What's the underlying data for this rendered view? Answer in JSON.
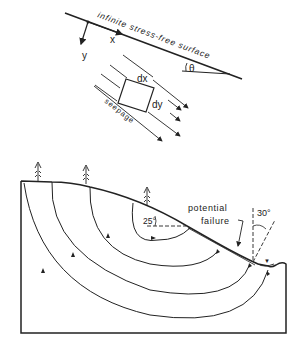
{
  "top_figure": {
    "surface_label": "infinite stress-free surface",
    "x_axis_label": "x",
    "y_axis_label": "y",
    "angle_label": "θ",
    "element_dx_label": "dx",
    "element_dy_label": "dy",
    "flow_label": "seepage"
  },
  "bottom_figure": {
    "angle_slope_label": "25°",
    "failure_label_line1": "potential",
    "failure_label_line2": "failure",
    "angle_seep_label": "30°",
    "trees": [
      "tree-1",
      "tree-2",
      "tree-3"
    ],
    "water_table_symbol": "▼"
  },
  "colors": {
    "ink": "#222222",
    "background": "#ffffff"
  }
}
